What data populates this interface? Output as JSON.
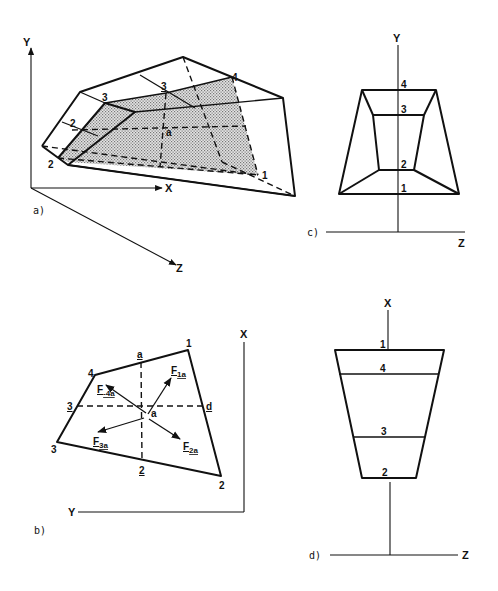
{
  "figure": {
    "panels": [
      {
        "id": "a",
        "caption": "a)",
        "axes": {
          "x": "X",
          "y": "Y",
          "z": "Z"
        },
        "labels": [
          {
            "text": "2",
            "note": "upper-left node"
          },
          {
            "text": "2",
            "note": "lower-left node"
          },
          {
            "text": "3",
            "note": "left node"
          },
          {
            "text": "3",
            "note": "center-top node (underlined)"
          },
          {
            "text": "4",
            "note": "upper-right node"
          },
          {
            "text": "a",
            "note": "center point"
          },
          {
            "text": "1",
            "note": "lower-right node"
          }
        ]
      },
      {
        "id": "b",
        "caption": "b)",
        "axes": {
          "x": "X",
          "y": "Y"
        },
        "corner_labels": [
          "1",
          "2",
          "3",
          "4"
        ],
        "midpoint_labels": [
          "a",
          "2",
          "3",
          "d"
        ],
        "center_label": "a",
        "force_vectors": [
          {
            "name": "F",
            "subscript": "1a"
          },
          {
            "name": "F",
            "subscript": "2a"
          },
          {
            "name": "F",
            "subscript": "3a"
          },
          {
            "name": "F",
            "subscript": "-4a"
          }
        ]
      },
      {
        "id": "c",
        "caption": "c)",
        "axes": {
          "vertical": "Y",
          "horizontal": "Z"
        },
        "level_labels": [
          "4",
          "3",
          "2",
          "1"
        ]
      },
      {
        "id": "d",
        "caption": "d)",
        "axes": {
          "vertical": "X",
          "horizontal": "Z"
        },
        "level_labels": [
          "1",
          "4",
          "3",
          "2"
        ]
      }
    ]
  },
  "colors": {
    "ink": "#111111",
    "background": "#ffffff",
    "stipple": "#8a8a8a"
  }
}
